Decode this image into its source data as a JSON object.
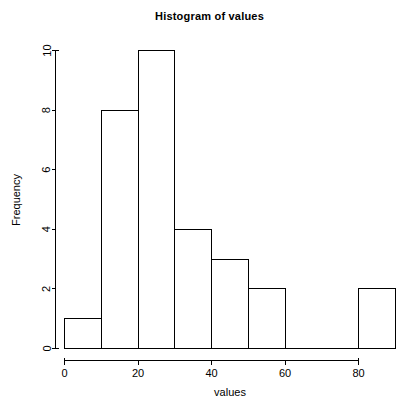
{
  "chart_data": {
    "type": "bar",
    "title": "Histogram of values",
    "xlabel": "values",
    "ylabel": "Frequency",
    "bin_width": 10,
    "bin_edges": [
      0,
      10,
      20,
      30,
      40,
      50,
      60,
      70,
      80,
      90
    ],
    "categories": [
      "0-10",
      "10-20",
      "20-30",
      "30-40",
      "40-50",
      "50-60",
      "60-70",
      "70-80",
      "80-90"
    ],
    "values": [
      1,
      8,
      10,
      4,
      3,
      2,
      0,
      0,
      2
    ],
    "xlim": [
      0,
      90
    ],
    "ylim": [
      0,
      10
    ],
    "xticks": [
      0,
      20,
      40,
      60,
      80
    ],
    "xtick_labels": [
      "0",
      "20",
      "40",
      "60",
      "80"
    ],
    "yticks": [
      0,
      2,
      4,
      6,
      8,
      10
    ],
    "ytick_labels": [
      "0",
      "2",
      "4",
      "6",
      "8",
      "10"
    ],
    "grid": false,
    "legend": false,
    "bar_fill": "#ffffff",
    "bar_stroke": "#000000",
    "axis_color": "#000000",
    "background": "#ffffff"
  }
}
